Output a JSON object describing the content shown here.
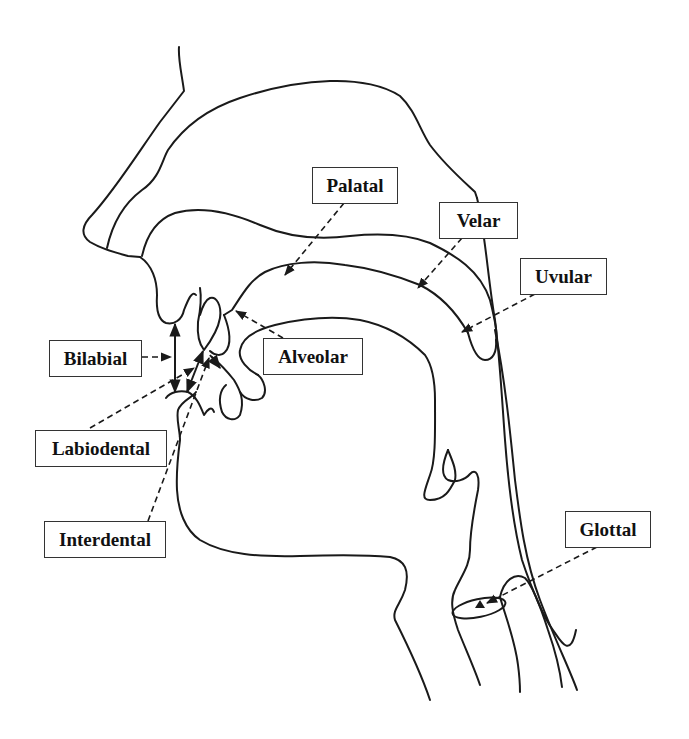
{
  "diagram": {
    "labels": {
      "palatal": "Palatal",
      "velar": "Velar",
      "uvular": "Uvular",
      "alveolar": "Alveolar",
      "bilabial": "Bilabial",
      "labiodental": "Labiodental",
      "interdental": "Interdental",
      "glottal": "Glottal"
    },
    "colors": {
      "line": "#1a1a1a",
      "box_border": "#333333",
      "background": "#ffffff"
    }
  }
}
